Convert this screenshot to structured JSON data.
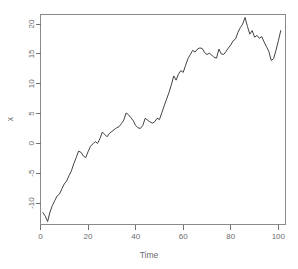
{
  "chart_data": {
    "type": "line",
    "title": "",
    "xlabel": "Time",
    "ylabel": "x",
    "xlim": [
      0,
      103
    ],
    "ylim": [
      -13.6,
      21.6
    ],
    "xticks": [
      0,
      20,
      40,
      60,
      80,
      100
    ],
    "yticks": [
      -10,
      -5,
      0,
      5,
      10,
      15,
      20
    ],
    "xtick_labels": [
      "0",
      "20",
      "40",
      "60",
      "80",
      "100"
    ],
    "ytick_labels": [
      "-10",
      "-5",
      "0",
      "5",
      "10",
      "15",
      "20"
    ],
    "grid": false,
    "legend": false,
    "legend_position": "none",
    "series": [
      {
        "name": "x",
        "color": "#2e2e2e",
        "x": [
          1,
          2,
          3,
          4,
          5,
          6,
          7,
          8,
          9,
          10,
          11,
          12,
          13,
          14,
          15,
          16,
          17,
          18,
          19,
          20,
          21,
          22,
          23,
          24,
          25,
          26,
          27,
          28,
          29,
          30,
          31,
          32,
          33,
          34,
          35,
          36,
          37,
          38,
          39,
          40,
          41,
          42,
          43,
          44,
          45,
          46,
          47,
          48,
          49,
          50,
          51,
          52,
          53,
          54,
          55,
          56,
          57,
          58,
          59,
          60,
          61,
          62,
          63,
          64,
          65,
          66,
          67,
          68,
          69,
          70,
          71,
          72,
          73,
          74,
          75,
          76,
          77,
          78,
          79,
          80,
          81,
          82,
          83,
          84,
          85,
          86,
          87,
          88,
          89,
          90,
          91,
          92,
          93,
          94,
          95,
          96,
          97,
          98,
          99,
          100,
          101
        ],
        "values": [
          -11.6,
          -12.2,
          -13.1,
          -11.5,
          -10.4,
          -9.6,
          -8.8,
          -8.5,
          -7.6,
          -6.8,
          -6.3,
          -5.4,
          -4.6,
          -3.4,
          -2.4,
          -1.3,
          -1.5,
          -2.1,
          -2.4,
          -1.4,
          -0.5,
          -0.1,
          0.3,
          0.0,
          0.8,
          1.9,
          1.5,
          1.1,
          1.7,
          2.0,
          2.3,
          2.6,
          2.8,
          3.3,
          3.9,
          5.1,
          4.8,
          4.3,
          3.8,
          3.0,
          2.6,
          2.5,
          3.0,
          4.2,
          3.9,
          3.6,
          3.4,
          3.6,
          4.2,
          4.0,
          5.1,
          6.3,
          7.4,
          8.5,
          9.8,
          11.3,
          10.6,
          11.6,
          12.2,
          11.9,
          13.1,
          14.2,
          14.9,
          15.6,
          15.3,
          15.8,
          16.0,
          15.9,
          15.2,
          14.9,
          15.1,
          14.8,
          14.4,
          14.3,
          15.8,
          15.0,
          14.9,
          15.4,
          16.0,
          16.5,
          17.2,
          17.5,
          18.6,
          19.4,
          20.0,
          21.1,
          19.6,
          18.3,
          18.9,
          17.8,
          18.1,
          17.6,
          17.9,
          17.0,
          16.2,
          15.4,
          13.9,
          14.2,
          15.6,
          17.2,
          18.9
        ]
      }
    ]
  },
  "axes": {
    "y_title": "x",
    "x_title": "Time"
  },
  "style": {
    "line_color": "#2e2e2e",
    "axis_color": "#707070",
    "frame_color": "#8a8a8a",
    "label_color": "#6b6b6b",
    "background": "#ffffff"
  }
}
